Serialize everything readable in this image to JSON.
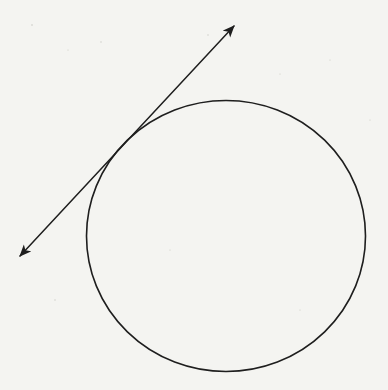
{
  "diagram": {
    "kind": "tangent-line-to-circle",
    "background_color": "#f4f4f1",
    "stroke_color": "#1e1e1e",
    "circle": {
      "cx": 226,
      "cy": 236,
      "rx": 139.5,
      "ry": 135.5,
      "stroke_width": 1.6
    },
    "tangent_line": {
      "x1": 20,
      "y1": 256,
      "x2": 234,
      "y2": 26,
      "stroke_width": 1.5,
      "arrowheads": [
        "start",
        "end"
      ]
    },
    "tangent_point": {
      "x": 118,
      "y": 145
    }
  }
}
